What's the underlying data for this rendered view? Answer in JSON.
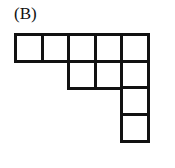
{
  "figure": {
    "label": "(B)",
    "cell_size": 29.5,
    "origin": {
      "x": 14,
      "y": 33
    },
    "cells": [
      {
        "row": 0,
        "col": 0
      },
      {
        "row": 0,
        "col": 1
      },
      {
        "row": 0,
        "col": 2
      },
      {
        "row": 0,
        "col": 3
      },
      {
        "row": 0,
        "col": 4
      },
      {
        "row": 1,
        "col": 2
      },
      {
        "row": 1,
        "col": 3
      },
      {
        "row": 1,
        "col": 4
      },
      {
        "row": 2,
        "col": 4
      },
      {
        "row": 3,
        "col": 4
      }
    ],
    "stroke_color": "#111111",
    "fill_color": "#ffffff"
  }
}
